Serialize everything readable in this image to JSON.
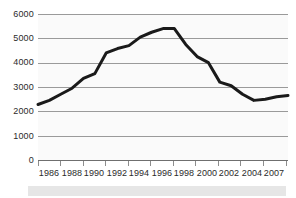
{
  "chart_data": {
    "type": "line",
    "title": "",
    "subtitle": "",
    "xlabel": "",
    "ylabel": "",
    "grid": true,
    "legend": false,
    "legend_position": "none",
    "series_color": "#1a1a1a",
    "plot_background": "#fafafa",
    "gridline_color": "#9a9a9a",
    "xlim": [
      1985,
      2007
    ],
    "ylim": [
      0,
      6000
    ],
    "y_ticks": [
      0,
      1000,
      2000,
      3000,
      4000,
      5000,
      6000
    ],
    "y_tick_labels": [
      "0",
      "1000",
      "2000",
      "3000",
      "4000",
      "5000",
      "6000"
    ],
    "x_tick_labels": [
      "1986",
      "1988",
      "1990",
      "1992",
      "1994",
      "1996",
      "1998",
      "2000",
      "2002",
      "2004",
      "2007"
    ],
    "x": [
      1985,
      1986,
      1987,
      1988,
      1989,
      1990,
      1991,
      1992,
      1993,
      1994,
      1995,
      1996,
      1997,
      1998,
      1999,
      2000,
      2001,
      2002,
      2003,
      2004,
      2005,
      2006,
      2007
    ],
    "values": [
      2280,
      2450,
      2700,
      2950,
      3350,
      3550,
      4400,
      4580,
      4700,
      5050,
      5250,
      5400,
      5400,
      4750,
      4250,
      4000,
      3200,
      3050,
      2700,
      2450,
      2500,
      2600,
      2650
    ],
    "series": [
      {
        "name": "series-1",
        "values": [
          2280,
          2450,
          2700,
          2950,
          3350,
          3550,
          4400,
          4580,
          4700,
          5050,
          5250,
          5400,
          5400,
          4750,
          4250,
          4000,
          3200,
          3050,
          2700,
          2450,
          2500,
          2600,
          2650
        ]
      }
    ],
    "annotations": []
  }
}
